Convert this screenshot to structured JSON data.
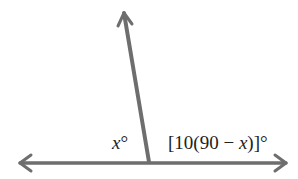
{
  "diagram": {
    "type": "angle-diagram",
    "labels": {
      "left_angle_var": "x",
      "left_angle_deg": "°",
      "right_angle_prefix": "[10(90 − ",
      "right_angle_var": "x",
      "right_angle_suffix": ")]°"
    },
    "stroke_color": "#6e6e6e",
    "text_color": "#222222"
  }
}
